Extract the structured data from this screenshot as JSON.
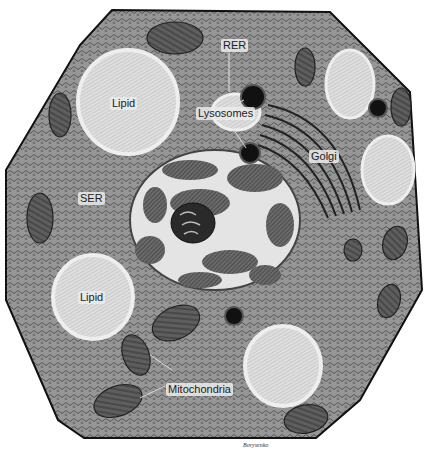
{
  "figure": {
    "colors": {
      "background": "#ffffff",
      "cytoplasm": "#8f8f8f",
      "cytoplasm_light": "#a8a8a8",
      "membrane": "#1a1a1a",
      "lipid": "#dcdcdc",
      "mitochondria": "#5a5a5a",
      "nucleus_bg": "#e6e6e6",
      "chromatin": "#4a4a4a",
      "lysosome": "#111111"
    }
  },
  "labels": {
    "rer": "RER",
    "lipid_top": "Lipid",
    "lysosomes": "Lysosomes",
    "golgi": "Golgi",
    "ser": "SER",
    "lipid_bottom": "Lipid",
    "mitochondria": "Mitochondria"
  },
  "signature": "Borysenko"
}
